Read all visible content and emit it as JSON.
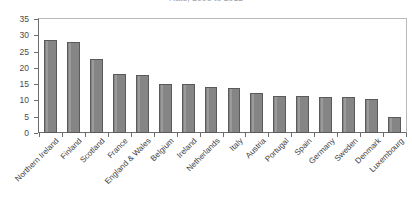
{
  "chart_data": {
    "type": "bar",
    "title": "Rate, 2008 to 2012",
    "xlabel": "",
    "ylabel": "",
    "ylim": [
      0,
      35
    ],
    "ytick_step": 5,
    "yticks": [
      0,
      5,
      10,
      15,
      20,
      25,
      30,
      35
    ],
    "grid": false,
    "legend": null,
    "bar_color": "#858585",
    "bar_edge_color": "#5a5a5a",
    "axis_color": "#6d6d6d",
    "frame_color": "#b9b9b9",
    "categories": [
      "Northern Ireland",
      "Finland",
      "Scotland",
      "France",
      "England & Wales",
      "Belgium",
      "Ireland",
      "Netherlands",
      "Italy",
      "Austria",
      "Portugal",
      "Spain",
      "Germany",
      "Sweden",
      "Denmark",
      "Luxembourg"
    ],
    "values": [
      28.7,
      27.9,
      22.7,
      18.2,
      17.7,
      15.2,
      15.0,
      14.2,
      13.9,
      12.4,
      11.4,
      11.3,
      11.2,
      11.1,
      10.4,
      5.0
    ]
  }
}
